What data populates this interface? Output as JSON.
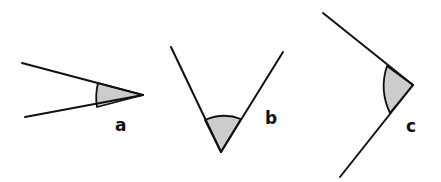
{
  "diagram": {
    "colors": {
      "line": "#111111",
      "shade": "#cccccc",
      "background": "#ffffff"
    },
    "angles": [
      {
        "label": "a",
        "type": "acute (narrow)"
      },
      {
        "label": "b",
        "type": "acute"
      },
      {
        "label": "c",
        "type": "obtuse-ish / right"
      }
    ]
  }
}
